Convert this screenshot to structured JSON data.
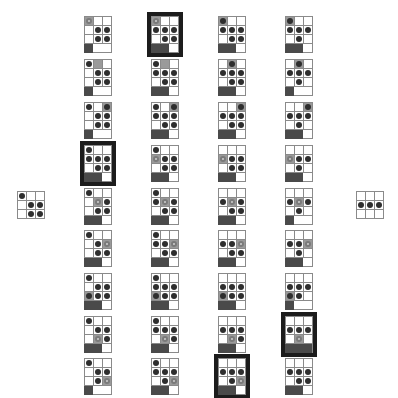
{
  "colors": {
    "dot": "#2e2e2e",
    "ring": "#7a7a7a",
    "grey_cell": "#9a9a9a",
    "bar": "#4a4a4a",
    "highlight": "#1c1c1c"
  },
  "legend": {
    "dot": "filled-dot",
    "ring": "hollow-ring",
    "g": "grey-cell",
    ".": "empty"
  },
  "start_state": {
    "rows": [
      [
        "dot",
        "",
        ""
      ],
      [
        "",
        "dot",
        "dot"
      ],
      [
        "",
        "dot",
        "dot"
      ]
    ]
  },
  "end_state": {
    "rows": [
      [
        "",
        "",
        ""
      ],
      [
        "dot",
        "dot",
        "dot"
      ],
      [
        "",
        "",
        ""
      ]
    ]
  },
  "columns": [
    {
      "x": 84,
      "cards": [
        {
          "y": 16,
          "hl": false,
          "bar": 1,
          "rows": [
            [
              "ring+g",
              "",
              ""
            ],
            [
              "",
              "dot",
              "dot"
            ],
            [
              "",
              "dot",
              "dot"
            ]
          ]
        },
        {
          "y": 59,
          "hl": false,
          "bar": 1,
          "rows": [
            [
              "dot",
              "g",
              ""
            ],
            [
              "",
              "dot",
              "dot"
            ],
            [
              "",
              "dot",
              "dot"
            ]
          ]
        },
        {
          "y": 102,
          "hl": false,
          "bar": 1,
          "rows": [
            [
              "dot",
              "",
              "dot+g"
            ],
            [
              "",
              "dot",
              "dot"
            ],
            [
              "",
              "dot",
              "dot"
            ]
          ]
        },
        {
          "y": 145,
          "hl": true,
          "bar": 2,
          "rows": [
            [
              "dot",
              "",
              ""
            ],
            [
              "dot",
              "dot",
              "dot"
            ],
            [
              "",
              "dot",
              "dot"
            ]
          ]
        },
        {
          "y": 188,
          "hl": false,
          "bar": 2,
          "rows": [
            [
              "dot",
              "",
              ""
            ],
            [
              "",
              "ring",
              "dot"
            ],
            [
              "",
              "dot",
              "dot"
            ]
          ]
        },
        {
          "y": 230,
          "hl": false,
          "bar": 2,
          "rows": [
            [
              "dot",
              "",
              ""
            ],
            [
              "",
              "dot",
              "ring"
            ],
            [
              "",
              "dot",
              "dot"
            ]
          ]
        },
        {
          "y": 273,
          "hl": false,
          "bar": 2,
          "rows": [
            [
              "dot",
              "",
              ""
            ],
            [
              "",
              "dot",
              "dot"
            ],
            [
              "dot+g",
              "dot",
              "dot"
            ]
          ]
        },
        {
          "y": 316,
          "hl": false,
          "bar": 2,
          "rows": [
            [
              "dot",
              "",
              ""
            ],
            [
              "",
              "dot",
              "dot"
            ],
            [
              "",
              "ring",
              "dot"
            ]
          ]
        },
        {
          "y": 358,
          "hl": false,
          "bar": 1,
          "rows": [
            [
              "dot",
              "",
              ""
            ],
            [
              "",
              "dot",
              "dot"
            ],
            [
              "",
              "dot",
              "ring"
            ]
          ]
        }
      ]
    },
    {
      "x": 151,
      "cards": [
        {
          "y": 16,
          "hl": true,
          "bar": 2,
          "rows": [
            [
              "ring+g",
              "",
              ""
            ],
            [
              "dot",
              "dot",
              "dot"
            ],
            [
              "",
              "dot",
              "dot"
            ]
          ]
        },
        {
          "y": 59,
          "hl": false,
          "bar": 2,
          "rows": [
            [
              "dot",
              "g",
              ""
            ],
            [
              "dot",
              "dot",
              "dot"
            ],
            [
              "",
              "dot",
              "dot"
            ]
          ]
        },
        {
          "y": 102,
          "hl": false,
          "bar": 2,
          "rows": [
            [
              "dot",
              "",
              "dot+g"
            ],
            [
              "dot",
              "dot",
              "dot"
            ],
            [
              "",
              "dot",
              "dot"
            ]
          ]
        },
        {
          "y": 145,
          "hl": false,
          "bar": 2,
          "rows": [
            [
              "dot",
              "",
              ""
            ],
            [
              "ring",
              "dot",
              "dot"
            ],
            [
              "",
              "dot",
              "dot"
            ]
          ]
        },
        {
          "y": 188,
          "hl": false,
          "bar": 2,
          "rows": [
            [
              "dot",
              "",
              ""
            ],
            [
              "dot",
              "ring",
              "dot"
            ],
            [
              "",
              "dot",
              "dot"
            ]
          ]
        },
        {
          "y": 230,
          "hl": false,
          "bar": 2,
          "rows": [
            [
              "dot",
              "",
              ""
            ],
            [
              "dot",
              "dot",
              "ring"
            ],
            [
              "",
              "dot",
              "dot"
            ]
          ]
        },
        {
          "y": 273,
          "hl": false,
          "bar": 2,
          "rows": [
            [
              "dot",
              "",
              ""
            ],
            [
              "dot",
              "dot",
              "dot"
            ],
            [
              "dot+g",
              "dot",
              "dot"
            ]
          ]
        },
        {
          "y": 316,
          "hl": false,
          "bar": 2,
          "rows": [
            [
              "dot",
              "",
              ""
            ],
            [
              "dot",
              "dot",
              "dot"
            ],
            [
              "",
              "ring",
              "dot"
            ]
          ]
        },
        {
          "y": 358,
          "hl": false,
          "bar": 2,
          "rows": [
            [
              "dot",
              "",
              ""
            ],
            [
              "dot",
              "dot",
              "dot"
            ],
            [
              "",
              "dot",
              "ring"
            ]
          ]
        }
      ]
    },
    {
      "x": 218,
      "cards": [
        {
          "y": 16,
          "hl": false,
          "bar": 2,
          "rows": [
            [
              "dot+g",
              "",
              ""
            ],
            [
              "dot",
              "dot",
              "dot"
            ],
            [
              "",
              "dot",
              "dot"
            ]
          ]
        },
        {
          "y": 59,
          "hl": false,
          "bar": 2,
          "rows": [
            [
              "",
              "dot+g",
              ""
            ],
            [
              "dot",
              "dot",
              "dot"
            ],
            [
              "",
              "dot",
              "dot"
            ]
          ]
        },
        {
          "y": 102,
          "hl": false,
          "bar": 2,
          "rows": [
            [
              "",
              "",
              "dot+g"
            ],
            [
              "dot",
              "dot",
              "dot"
            ],
            [
              "",
              "dot",
              "dot"
            ]
          ]
        },
        {
          "y": 145,
          "hl": false,
          "bar": 2,
          "rows": [
            [
              "",
              "",
              ""
            ],
            [
              "ring",
              "dot",
              "dot"
            ],
            [
              "",
              "dot",
              "dot"
            ]
          ]
        },
        {
          "y": 188,
          "hl": false,
          "bar": 2,
          "rows": [
            [
              "",
              "",
              ""
            ],
            [
              "dot",
              "ring",
              "dot"
            ],
            [
              "",
              "dot",
              "dot"
            ]
          ]
        },
        {
          "y": 230,
          "hl": false,
          "bar": 2,
          "rows": [
            [
              "",
              "",
              ""
            ],
            [
              "dot",
              "dot",
              "ring"
            ],
            [
              "",
              "dot",
              "dot"
            ]
          ]
        },
        {
          "y": 273,
          "hl": false,
          "bar": 2,
          "rows": [
            [
              "",
              "",
              ""
            ],
            [
              "dot",
              "dot",
              "dot"
            ],
            [
              "dot+g",
              "dot",
              "dot"
            ]
          ]
        },
        {
          "y": 316,
          "hl": false,
          "bar": 2,
          "rows": [
            [
              "",
              "",
              ""
            ],
            [
              "dot",
              "dot",
              "dot"
            ],
            [
              "",
              "ring",
              "dot"
            ]
          ]
        },
        {
          "y": 358,
          "hl": true,
          "bar": 2,
          "rows": [
            [
              "",
              "",
              ""
            ],
            [
              "dot",
              "dot",
              "dot"
            ],
            [
              "",
              "dot",
              "ring"
            ]
          ]
        }
      ]
    },
    {
      "x": 285,
      "cards": [
        {
          "y": 16,
          "hl": false,
          "bar": 2,
          "rows": [
            [
              "dot+g",
              "",
              ""
            ],
            [
              "dot",
              "dot",
              "dot"
            ],
            [
              "",
              "dot",
              ""
            ]
          ]
        },
        {
          "y": 59,
          "hl": false,
          "bar": 1,
          "rows": [
            [
              "",
              "dot+g",
              ""
            ],
            [
              "dot",
              "dot",
              "dot"
            ],
            [
              "",
              "dot",
              ""
            ]
          ]
        },
        {
          "y": 102,
          "hl": false,
          "bar": 2,
          "rows": [
            [
              "",
              "",
              "dot+g"
            ],
            [
              "dot",
              "dot",
              "dot"
            ],
            [
              "",
              "dot",
              ""
            ]
          ]
        },
        {
          "y": 145,
          "hl": false,
          "bar": 2,
          "rows": [
            [
              "",
              "",
              ""
            ],
            [
              "ring",
              "dot",
              "dot"
            ],
            [
              "",
              "dot",
              ""
            ]
          ]
        },
        {
          "y": 188,
          "hl": false,
          "bar": 1,
          "rows": [
            [
              "",
              "",
              ""
            ],
            [
              "dot",
              "ring",
              "dot"
            ],
            [
              "",
              "dot",
              ""
            ]
          ]
        },
        {
          "y": 230,
          "hl": false,
          "bar": 2,
          "rows": [
            [
              "",
              "",
              ""
            ],
            [
              "dot",
              "dot",
              "ring"
            ],
            [
              "",
              "dot",
              ""
            ]
          ]
        },
        {
          "y": 273,
          "hl": false,
          "bar": 1,
          "rows": [
            [
              "",
              "",
              ""
            ],
            [
              "dot",
              "dot",
              "dot"
            ],
            [
              "dot+g",
              "dot",
              ""
            ]
          ]
        },
        {
          "y": 316,
          "hl": true,
          "bar": 3,
          "rows": [
            [
              "",
              "",
              ""
            ],
            [
              "dot",
              "dot",
              "dot"
            ],
            [
              "",
              "ring",
              ""
            ]
          ]
        },
        {
          "y": 358,
          "hl": false,
          "bar": 2,
          "rows": [
            [
              "",
              "",
              ""
            ],
            [
              "dot",
              "dot",
              "dot"
            ],
            [
              "",
              "dot",
              "dot"
            ]
          ]
        }
      ]
    }
  ]
}
